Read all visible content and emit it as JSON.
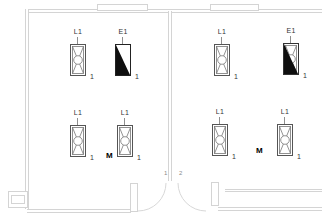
{
  "drawing": {
    "fixtures": [
      {
        "label": "L1",
        "count": "1",
        "type": "luminaire"
      },
      {
        "label": "E1",
        "count": "1",
        "type": "emergency-exit-light"
      },
      {
        "label": "L1",
        "count": "1",
        "type": "luminaire"
      },
      {
        "label": "E1",
        "count": "1",
        "type": "emergency-luminaire"
      },
      {
        "label": "L1",
        "count": "1",
        "type": "luminaire"
      },
      {
        "label": "L1",
        "count": "1",
        "type": "luminaire",
        "marker": "M"
      },
      {
        "label": "L1",
        "count": "1",
        "type": "luminaire"
      },
      {
        "label": "L1",
        "count": "1",
        "type": "luminaire"
      }
    ],
    "markers": {
      "motion_sensor": "M"
    },
    "door": {
      "leaf_labels": [
        "1",
        "2"
      ]
    },
    "colors": {
      "wall_line": "#d4d4d4",
      "symbol_outline": "#555555",
      "symbol_fill": "#0f0f0f",
      "label_text": "#333333",
      "door_text": "#8a8a8a"
    }
  }
}
